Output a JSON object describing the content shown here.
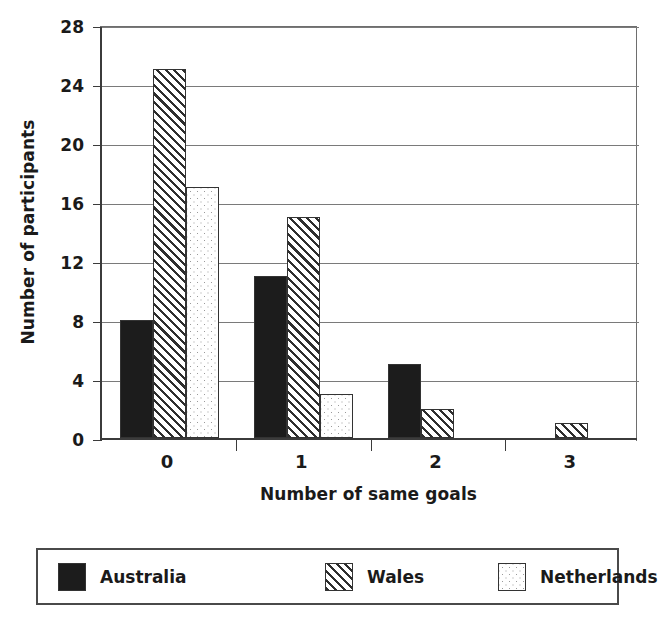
{
  "chart_data": {
    "type": "bar",
    "title": "",
    "xlabel": "Number of same goals",
    "ylabel": "Number of participants",
    "categories": [
      "0",
      "1",
      "2",
      "3"
    ],
    "series": [
      {
        "name": "Australia",
        "pattern": "solid",
        "values": [
          8,
          11,
          5,
          0
        ]
      },
      {
        "name": "Wales",
        "pattern": "hatch",
        "values": [
          25,
          15,
          2,
          1
        ]
      },
      {
        "name": "Netherlands",
        "pattern": "dots",
        "values": [
          17,
          3,
          0,
          0
        ]
      }
    ],
    "ylim": [
      0,
      28
    ],
    "yticks": [
      0,
      4,
      8,
      12,
      16,
      20,
      24,
      28
    ],
    "grid": "horizontal",
    "legend_position": "bottom",
    "colors": {
      "australia": "#1c1c1c",
      "wales": "#2e2e2e",
      "netherlands": "#9a9a9a",
      "axis": "#3b3b3b",
      "gridline": "#7a7a7a",
      "background": "#ffffff"
    }
  },
  "legend": {
    "items": [
      {
        "label": "Australia"
      },
      {
        "label": "Wales"
      },
      {
        "label": "Netherlands"
      }
    ]
  }
}
